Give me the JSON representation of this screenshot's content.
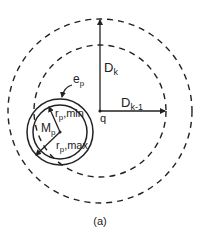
{
  "diagram": {
    "caption": "(a)",
    "center_label": "q",
    "outer_radius_label": {
      "main": "D",
      "sub": "k"
    },
    "inner_radius_label": {
      "main": "D",
      "sub": "k-1"
    },
    "particle_center_label": {
      "main": "M",
      "sub": "p"
    },
    "edge_label": {
      "main": "e",
      "sub": "p"
    },
    "rmin_label": {
      "main": "r",
      "sub": "p",
      "suffix": ",min"
    },
    "rmax_label": {
      "main": "r",
      "sub": "p",
      "suffix": ",max"
    },
    "colors": {
      "stroke": "#222222",
      "background": "#ffffff"
    }
  }
}
